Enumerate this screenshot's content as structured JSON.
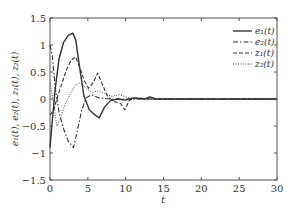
{
  "chart_data": {
    "type": "line",
    "title": "",
    "xlabel": "t",
    "ylabel": "e1(t), e2(t), z1(t), z2(t)",
    "xlim": [
      0,
      30
    ],
    "ylim": [
      -1.5,
      1.5
    ],
    "xticks": [
      0,
      5,
      10,
      15,
      20,
      25,
      30
    ],
    "yticks": [
      -1.5,
      -1,
      -0.5,
      0,
      0.5,
      1,
      1.5
    ],
    "xtick_labels": [
      "0",
      "5",
      "10",
      "15",
      "20",
      "25",
      "30"
    ],
    "ytick_labels": [
      "−1.5",
      "−1",
      "−0.5",
      "0",
      "0.5",
      "1",
      "1.5"
    ],
    "grid": false,
    "legend_position": "upper right",
    "series": [
      {
        "name": "e1(t)",
        "style": "solid",
        "x": [
          0,
          0.3,
          0.7,
          1.2,
          1.8,
          2.4,
          3.0,
          3.4,
          3.9,
          4.5,
          5.2,
          5.8,
          6.5,
          7.2,
          8.0,
          9.0,
          10.0,
          11.0,
          12.5,
          13.2,
          14.0,
          16,
          20,
          25,
          30
        ],
        "y": [
          -0.9,
          -0.4,
          0.2,
          0.75,
          1.05,
          1.18,
          1.22,
          1.1,
          0.6,
          0.05,
          -0.2,
          -0.28,
          -0.35,
          -0.15,
          -0.03,
          0.0,
          -0.02,
          0.02,
          0.0,
          0.04,
          0.0,
          0.0,
          0.0,
          0.0,
          0.0
        ]
      },
      {
        "name": "e2(t)",
        "style": "dashdot",
        "x": [
          0,
          0.3,
          0.7,
          1.2,
          1.8,
          2.4,
          3.1,
          3.6,
          4.2,
          4.8,
          5.5,
          6.5,
          8,
          10,
          15,
          20,
          25,
          30
        ],
        "y": [
          1.0,
          0.8,
          0.2,
          -0.25,
          -0.55,
          -0.78,
          -0.9,
          -0.6,
          -0.2,
          0.02,
          0.08,
          0.02,
          0.0,
          0.0,
          0.0,
          0.0,
          0.0,
          0.0
        ]
      },
      {
        "name": "z1(t)",
        "style": "dashed",
        "x": [
          0,
          0.5,
          1.0,
          1.6,
          2.2,
          2.8,
          3.4,
          3.9,
          4.5,
          5.1,
          5.7,
          6.3,
          6.9,
          7.6,
          8.5,
          9.3,
          9.9,
          10.5,
          11.5,
          13,
          15,
          20,
          25,
          30
        ],
        "y": [
          -0.3,
          -0.2,
          0.05,
          0.3,
          0.55,
          0.72,
          0.78,
          0.6,
          0.35,
          0.2,
          0.3,
          0.48,
          0.28,
          0.05,
          -0.05,
          -0.08,
          -0.2,
          -0.02,
          0.02,
          0.0,
          0.0,
          0.0,
          0.0,
          0.0
        ]
      },
      {
        "name": "z2(t)",
        "style": "dotted",
        "x": [
          0,
          0.4,
          0.9,
          1.4,
          2.0,
          2.7,
          3.3,
          4.0,
          4.8,
          5.5,
          6.3,
          7.2,
          8.2,
          9.2,
          10.2,
          11.5,
          13,
          15,
          20,
          25,
          30
        ],
        "y": [
          0.3,
          0.0,
          -0.5,
          -0.35,
          -0.1,
          0.1,
          0.25,
          0.3,
          0.2,
          0.12,
          0.15,
          0.1,
          0.05,
          0.08,
          0.03,
          0.0,
          0.0,
          0.0,
          0.0,
          0.0,
          0.0
        ]
      }
    ]
  },
  "legend": {
    "items": [
      {
        "label": "e₁(t)",
        "style": "solid"
      },
      {
        "label": "e₂(t)",
        "style": "dashdot"
      },
      {
        "label": "z₁(t)",
        "style": "dashed"
      },
      {
        "label": "z₂(t)",
        "style": "dotted"
      }
    ]
  },
  "axes": {
    "xlabel": "t",
    "ylabel": "e₁(t), e₂(t), z₁(t), z₂(t)"
  },
  "colors": {
    "line": "#333333",
    "frame": "#555555"
  }
}
